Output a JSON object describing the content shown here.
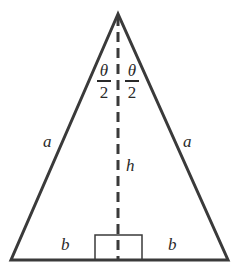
{
  "diagram": {
    "colors": {
      "stroke": "#3a3a3a",
      "text": "#2a2a2a",
      "background": "#ffffff"
    },
    "labels": {
      "left_side": "a",
      "right_side": "a",
      "height": "h",
      "left_half_base": "b",
      "right_half_base": "b",
      "left_angle": {
        "numerator": "θ",
        "denominator": "2"
      },
      "right_angle": {
        "numerator": "θ",
        "denominator": "2"
      }
    },
    "geometry": {
      "apex": [
        118,
        14
      ],
      "base_left": [
        11,
        260
      ],
      "base_right": [
        228,
        260
      ],
      "altitude_x": 118,
      "right_angle_box": {
        "x1": 95,
        "y1": 235,
        "x2": 142,
        "y2": 260
      }
    }
  }
}
